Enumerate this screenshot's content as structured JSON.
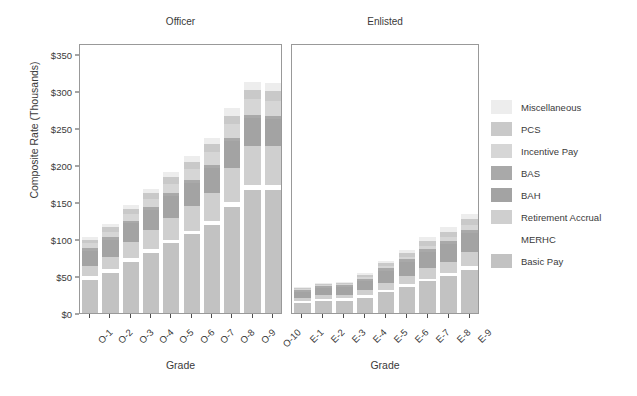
{
  "chart_data": {
    "type": "bar",
    "stacked": true,
    "title": "",
    "xlabel": "Grade",
    "ylabel": "Composite Rate (Thousands)",
    "ylim": [
      0,
      365
    ],
    "ytick_values": [
      0,
      50,
      100,
      150,
      200,
      250,
      300,
      350
    ],
    "ytick_labels": [
      "$0",
      "$50",
      "$100",
      "$150",
      "$200",
      "$250",
      "$300",
      "$350"
    ],
    "grid": false,
    "legend_position": "right",
    "series": [
      {
        "name": "Basic Pay",
        "color": "#c2c2c2"
      },
      {
        "name": "MERHC",
        "color": "#ffffff"
      },
      {
        "name": "Retirement Accrual",
        "color": "#cfcfcf"
      },
      {
        "name": "BAH",
        "color": "#a3a3a3"
      },
      {
        "name": "BAS",
        "color": "#a9a9a9"
      },
      {
        "name": "Incentive Pay",
        "color": "#d6d6d6"
      },
      {
        "name": "PCS",
        "color": "#c9c9c9"
      },
      {
        "name": "Miscellaneous",
        "color": "#ededed"
      }
    ],
    "legend_order": [
      "Miscellaneous",
      "PCS",
      "Incentive Pay",
      "BAS",
      "BAH",
      "Retirement Accrual",
      "MERHC",
      "Basic Pay"
    ],
    "panels": [
      {
        "title": "Officer",
        "categories": [
          "O-1",
          "O-2",
          "O-3",
          "O-4",
          "O-5",
          "O-6",
          "O-7",
          "O-8",
          "O-9",
          "O-10"
        ],
        "stack_order": [
          "Basic Pay",
          "MERHC",
          "Retirement Accrual",
          "BAH",
          "BAS",
          "Incentive Pay",
          "PCS",
          "Miscellaneous"
        ],
        "values": {
          "Basic Pay": [
            45,
            55,
            70,
            82,
            95,
            107,
            120,
            145,
            168,
            168
          ],
          "MERHC": [
            5,
            5,
            5,
            5,
            5,
            5,
            6,
            6,
            6,
            6
          ],
          "Retirement Accrual": [
            14,
            17,
            22,
            26,
            30,
            34,
            38,
            46,
            53,
            53
          ],
          "BAH": [
            21,
            23,
            25,
            27,
            29,
            31,
            34,
            37,
            39,
            37
          ],
          "BAS": [
            4,
            4,
            4,
            4,
            4,
            4,
            4,
            4,
            4,
            4
          ],
          "Incentive Pay": [
            6,
            7,
            9,
            11,
            13,
            15,
            17,
            19,
            21,
            21
          ],
          "PCS": [
            5,
            6,
            7,
            8,
            9,
            10,
            11,
            12,
            13,
            13
          ],
          "Miscellaneous": [
            3,
            4,
            5,
            6,
            7,
            8,
            9,
            10,
            11,
            11
          ]
        },
        "totals": [
          103,
          121,
          147,
          169,
          192,
          214,
          239,
          279,
          315,
          313
        ]
      },
      {
        "title": "Enlisted",
        "categories": [
          "E-1",
          "E-2",
          "E-3",
          "E-4",
          "E-5",
          "E-6",
          "E-7",
          "E-8",
          "E-9"
        ],
        "stack_order": [
          "Basic Pay",
          "MERHC",
          "Retirement Accrual",
          "BAH",
          "BAS",
          "Incentive Pay",
          "PCS",
          "Miscellaneous"
        ],
        "values": {
          "Basic Pay": [
            14,
            16,
            17,
            21,
            28,
            35,
            43,
            50,
            59
          ],
          "MERHC": [
            3,
            3,
            3,
            3,
            4,
            4,
            4,
            4,
            5
          ],
          "Retirement Accrual": [
            4,
            5,
            5,
            7,
            9,
            11,
            14,
            16,
            19
          ],
          "BAH": [
            8,
            10,
            10,
            13,
            16,
            19,
            22,
            24,
            26
          ],
          "BAS": [
            3,
            3,
            3,
            3,
            4,
            4,
            4,
            4,
            4
          ],
          "Incentive Pay": [
            1,
            1,
            1,
            2,
            3,
            4,
            5,
            6,
            7
          ],
          "PCS": [
            1,
            2,
            2,
            3,
            4,
            5,
            6,
            7,
            8
          ],
          "Miscellaneous": [
            1,
            1,
            1,
            2,
            3,
            4,
            5,
            6,
            7
          ]
        },
        "totals": [
          35,
          41,
          42,
          54,
          71,
          86,
          103,
          117,
          135
        ]
      }
    ]
  },
  "axis": {
    "y_title": "Composite Rate (Thousands)",
    "x_title_left": "Grade",
    "x_title_right": "Grade"
  },
  "legend": {
    "items": [
      {
        "label": "Miscellaneous",
        "color": "#ededed"
      },
      {
        "label": "PCS",
        "color": "#c9c9c9"
      },
      {
        "label": "Incentive Pay",
        "color": "#d6d6d6"
      },
      {
        "label": "BAS",
        "color": "#a9a9a9"
      },
      {
        "label": "BAH",
        "color": "#a3a3a3"
      },
      {
        "label": "Retirement Accrual",
        "color": "#cfcfcf"
      },
      {
        "label": "MERHC",
        "color": "#ffffff"
      },
      {
        "label": "Basic Pay",
        "color": "#c2c2c2"
      }
    ]
  }
}
